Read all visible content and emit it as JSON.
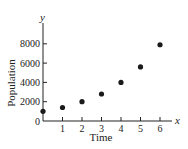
{
  "chart_data": {
    "type": "scatter",
    "title": "",
    "xlabel": "Time",
    "ylabel": "Population",
    "x_axis_var": "x",
    "y_axis_var": "y",
    "x": [
      0,
      1,
      2,
      3,
      4,
      5,
      6
    ],
    "values": [
      1000,
      1400,
      2000,
      2800,
      4000,
      5600,
      7900
    ],
    "x_ticks": [
      "1",
      "2",
      "3",
      "4",
      "5",
      "6"
    ],
    "y_ticks": [
      "0",
      "2000",
      "4000",
      "6000",
      "8000"
    ],
    "xlim": [
      0,
      6.5
    ],
    "ylim": [
      0,
      9000
    ],
    "grid": false,
    "legend": null,
    "marker_color": "#1a1a1a"
  }
}
